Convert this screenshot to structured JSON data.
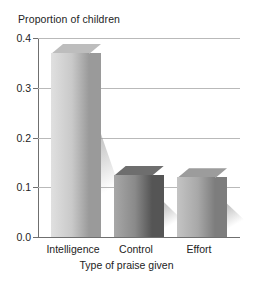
{
  "chart_data": {
    "type": "bar",
    "title": "",
    "subtitle": "",
    "xlabel": "Type of praise given",
    "ylabel": "Proportion of children",
    "categories": [
      "Intelligence",
      "Control",
      "Effort"
    ],
    "values": [
      0.37,
      0.125,
      0.12
    ],
    "series": [
      {
        "name": "Proportion of children",
        "values": [
          0.37,
          0.125,
          0.12
        ]
      }
    ],
    "ylim": [
      0.0,
      0.4
    ],
    "ytick_labels": [
      "0.0",
      "0.1",
      "0.2",
      "0.3",
      "0.4"
    ],
    "ytick_values": [
      0.0,
      0.1,
      0.2,
      0.3,
      0.4
    ],
    "grid": true,
    "legend": false,
    "legend_position": "none",
    "style": "3d-extruded-bars-with-shadow",
    "bar_colors": [
      "#c9c9c9",
      "#8a8a8a",
      "#a8a8a8"
    ],
    "background": "#ffffff",
    "gridline_color": "#b9b9b9",
    "axis_color": "#6f6f6f",
    "text_color": "#232323"
  },
  "axis": {
    "y_title": "Proportion of children",
    "x_title": "Type of praise given"
  },
  "ticks": {
    "y": [
      {
        "label": "0.4",
        "value": 0.4
      },
      {
        "label": "0.3",
        "value": 0.3
      },
      {
        "label": "0.2",
        "value": 0.2
      },
      {
        "label": "0.1",
        "value": 0.1
      },
      {
        "label": "0.0",
        "value": 0.0
      }
    ]
  },
  "bars": [
    {
      "label": "Intelligence",
      "value": 0.37,
      "color": "#c9c9c9"
    },
    {
      "label": "Control",
      "value": 0.125,
      "color": "#8a8a8a"
    },
    {
      "label": "Effort",
      "value": 0.12,
      "color": "#a8a8a8"
    }
  ]
}
